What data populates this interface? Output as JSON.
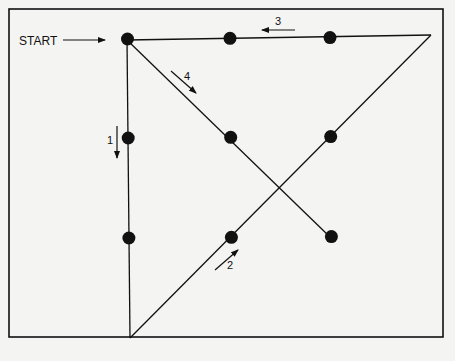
{
  "diagram": {
    "start_label": "START",
    "step_labels": [
      "1",
      "2",
      "3",
      "4"
    ],
    "dots": [
      {
        "row": 1,
        "col": 1
      },
      {
        "row": 1,
        "col": 2
      },
      {
        "row": 1,
        "col": 3
      },
      {
        "row": 2,
        "col": 1
      },
      {
        "row": 2,
        "col": 2
      },
      {
        "row": 2,
        "col": 3
      },
      {
        "row": 3,
        "col": 1
      },
      {
        "row": 3,
        "col": 2
      },
      {
        "row": 3,
        "col": 3
      }
    ],
    "path_steps": [
      {
        "step": "1",
        "direction": "down",
        "description": "from start down through left column past the bottom"
      },
      {
        "step": "2",
        "direction": "up-right",
        "description": "diagonal up through bottom-middle and middle-right dots beyond the top-right"
      },
      {
        "step": "3",
        "direction": "left",
        "description": "back along the top row to start"
      },
      {
        "step": "4",
        "direction": "down-right",
        "description": "diagonal through center to bottom-right dot"
      }
    ],
    "colors": {
      "ink": "#111111",
      "paper": "#f4f4f2"
    }
  }
}
